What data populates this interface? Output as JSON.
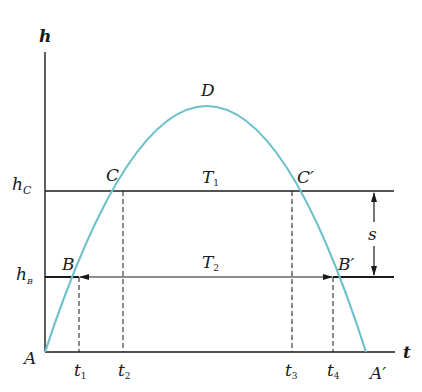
{
  "diagram": {
    "type": "height-time parabola (projectile / vertical throw)",
    "colors": {
      "curve": "#6cc0cc",
      "lines": "#1a1a1a",
      "background": "#ffffff"
    },
    "axes": {
      "y_label": "h",
      "x_label": "t",
      "origin_label": "A"
    },
    "levels": {
      "hc": {
        "label": "h",
        "sub": "C"
      },
      "hb": {
        "label": "h",
        "sub": "B"
      }
    },
    "points": {
      "A": "A",
      "A_prime": "A′",
      "B": "B",
      "B_prime": "B′",
      "C": "C",
      "C_prime": "C′",
      "D": "D"
    },
    "intervals": {
      "T1": {
        "label": "T",
        "sub": "1"
      },
      "T2": {
        "label": "T",
        "sub": "2"
      },
      "s": "s"
    },
    "time_ticks": [
      {
        "label": "t",
        "sub": "1"
      },
      {
        "label": "t",
        "sub": "2"
      },
      {
        "label": "t",
        "sub": "3"
      },
      {
        "label": "t",
        "sub": "4"
      }
    ]
  }
}
